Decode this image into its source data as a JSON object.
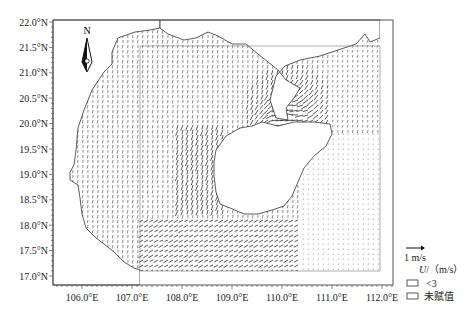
{
  "map": {
    "type": "vector-field",
    "region": "Beibu Gulf / Qiongzhou Strait (Hainan Island)",
    "frame": {
      "left": 53,
      "top": 20,
      "right": 393,
      "bottom": 285
    },
    "lon_range": [
      105.42,
      112.2
    ],
    "lat_range": [
      16.85,
      22.05
    ],
    "x_axis": {
      "ticks": [
        "106.0°E",
        "107.0°E",
        "108.0°E",
        "109.0°E",
        "110.0°E",
        "111.0°E",
        "112.0°E"
      ],
      "values": [
        106.0,
        107.0,
        108.0,
        109.0,
        110.0,
        111.0,
        112.0
      ]
    },
    "y_axis": {
      "ticks": [
        "22.0°N",
        "21.5°N",
        "21.0°N",
        "20.5°N",
        "20.0°N",
        "19.5°N",
        "19.0°N",
        "18.5°N",
        "18.0°N",
        "17.5°N",
        "17.0°N"
      ],
      "values": [
        22.0,
        21.5,
        21.0,
        20.5,
        20.0,
        19.5,
        19.0,
        18.5,
        18.0,
        17.5,
        17.0
      ]
    },
    "north_arrow": {
      "label": "N"
    },
    "colors": {
      "frame": "#555555",
      "coast": "#333333",
      "arrow": "#1a1a1a",
      "background": "#ffffff"
    }
  },
  "legend": {
    "scale_label": "1 m/s",
    "title_var": "U",
    "title_unit": "/（m/s）",
    "items": [
      {
        "label": "<3",
        "swatch": "#ffffff"
      },
      {
        "label": "未赋值",
        "swatch": "#ffffff"
      }
    ]
  }
}
